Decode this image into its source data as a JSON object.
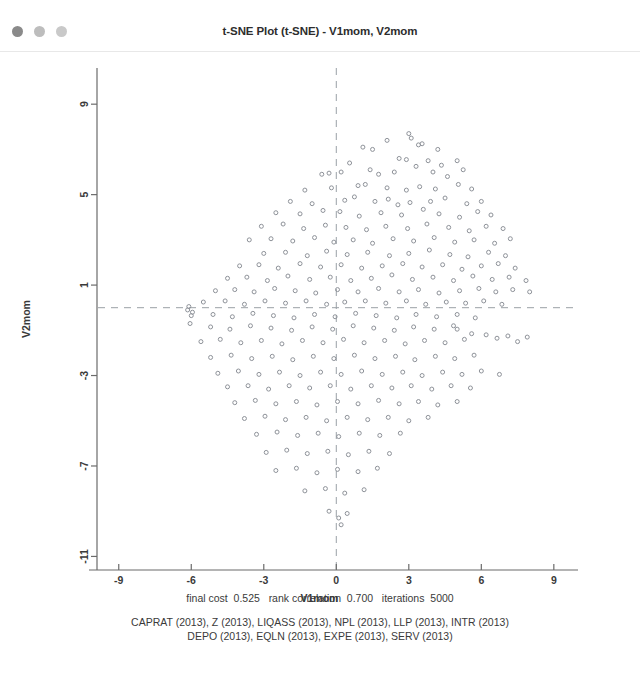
{
  "window": {
    "title": "t-SNE Plot (t-SNE) - V1mom, V2mom",
    "traffic_lights": [
      {
        "name": "close-dot",
        "color": "#8a8a8a"
      },
      {
        "name": "minimize-dot",
        "color": "#bdbdbd"
      },
      {
        "name": "maximize-dot",
        "color": "#c9c9c9"
      }
    ]
  },
  "captions": {
    "fit_stats": "final cost  0.525   rank correlation  0.700   iterations  5000",
    "fit_stats_parts": {
      "final_cost_label": "final cost",
      "final_cost_value": "0.525",
      "rank_correlation_label": "rank correlation",
      "rank_correlation_value": "0.700",
      "iterations_label": "iterations",
      "iterations_value": "5000"
    },
    "variable_line_1": "CAPRAT (2013), Z (2013), LIQASS (2013), NPL (2013), LLP (2013), INTR (2013)",
    "variable_line_2": "DEPO (2013), EQLN (2013), EXPE (2013), SERV (2013)",
    "variables": [
      "CAPRAT (2013)",
      "Z (2013)",
      "LIQASS (2013)",
      "NPL (2013)",
      "LLP (2013)",
      "INTR (2013)",
      "DEPO (2013)",
      "EQLN (2013)",
      "EXPE (2013)",
      "SERV (2013)"
    ]
  },
  "style": {
    "axis_color": "#6b6b6b",
    "marker_stroke": "#8e9299",
    "reference_line_color": "#9aa0a6",
    "text_color": "#3a3a3a",
    "background": "#ffffff"
  },
  "chart_data": {
    "type": "scatter",
    "title": "t-SNE Plot (t-SNE) - V1mom, V2mom",
    "xlabel": "V1mom",
    "ylabel": "V2mom",
    "xlim": [
      -9.9,
      10.0
    ],
    "ylim": [
      -11.6,
      10.6
    ],
    "xticks": [
      -9,
      -6,
      -3,
      0,
      3,
      6,
      9
    ],
    "yticks": [
      9,
      5,
      1,
      -3,
      -7,
      -11
    ],
    "grid": false,
    "legend": null,
    "marker": {
      "shape": "circle-open",
      "size": 4
    },
    "reference_lines": [
      {
        "orientation": "vertical",
        "value": 0.0,
        "style": "dashed"
      },
      {
        "orientation": "horizontal",
        "value": 0.0,
        "style": "dashed"
      }
    ],
    "n_points": 282,
    "points": [
      [
        1.1,
        7.1
      ],
      [
        1.5,
        7.0
      ],
      [
        2.1,
        7.4
      ],
      [
        3.0,
        7.7
      ],
      [
        3.1,
        7.5
      ],
      [
        3.4,
        7.2
      ],
      [
        3.55,
        7.25
      ],
      [
        4.2,
        7.0
      ],
      [
        0.2,
        6.0
      ],
      [
        0.55,
        6.4
      ],
      [
        2.6,
        6.6
      ],
      [
        2.9,
        6.55
      ],
      [
        3.8,
        6.5
      ],
      [
        4.35,
        6.3
      ],
      [
        5.0,
        6.5
      ],
      [
        -0.6,
        5.9
      ],
      [
        -0.3,
        5.95
      ],
      [
        1.4,
        6.1
      ],
      [
        1.75,
        5.9
      ],
      [
        2.4,
        6.0
      ],
      [
        3.3,
        6.25
      ],
      [
        4.0,
        6.0
      ],
      [
        4.6,
        5.8
      ],
      [
        5.25,
        6.1
      ],
      [
        -1.3,
        5.2
      ],
      [
        -0.2,
        5.3
      ],
      [
        0.9,
        5.4
      ],
      [
        1.2,
        5.45
      ],
      [
        2.1,
        5.3
      ],
      [
        2.9,
        5.2
      ],
      [
        3.45,
        5.35
      ],
      [
        4.1,
        5.25
      ],
      [
        5.05,
        5.45
      ],
      [
        5.6,
        5.25
      ],
      [
        -1.9,
        4.7
      ],
      [
        -1.0,
        4.6
      ],
      [
        0.35,
        4.75
      ],
      [
        0.75,
        4.9
      ],
      [
        1.6,
        4.7
      ],
      [
        2.15,
        4.8
      ],
      [
        2.55,
        4.55
      ],
      [
        3.05,
        4.65
      ],
      [
        3.9,
        4.7
      ],
      [
        4.5,
        4.85
      ],
      [
        5.4,
        4.6
      ],
      [
        6.0,
        4.7
      ],
      [
        -2.5,
        4.2
      ],
      [
        -1.5,
        4.15
      ],
      [
        -0.55,
        4.3
      ],
      [
        0.15,
        4.25
      ],
      [
        0.95,
        4.05
      ],
      [
        1.85,
        4.2
      ],
      [
        2.7,
        4.1
      ],
      [
        3.6,
        4.35
      ],
      [
        4.25,
        4.15
      ],
      [
        5.1,
        4.0
      ],
      [
        5.85,
        4.25
      ],
      [
        6.4,
        4.1
      ],
      [
        -3.1,
        3.6
      ],
      [
        -2.2,
        3.7
      ],
      [
        -1.35,
        3.5
      ],
      [
        -0.45,
        3.65
      ],
      [
        0.4,
        3.55
      ],
      [
        1.25,
        3.45
      ],
      [
        2.05,
        3.6
      ],
      [
        2.95,
        3.5
      ],
      [
        3.75,
        3.7
      ],
      [
        4.65,
        3.55
      ],
      [
        5.5,
        3.4
      ],
      [
        6.2,
        3.6
      ],
      [
        6.9,
        3.5
      ],
      [
        -3.6,
        3.0
      ],
      [
        -2.7,
        3.05
      ],
      [
        -1.8,
        2.95
      ],
      [
        -0.9,
        3.1
      ],
      [
        -0.1,
        2.9
      ],
      [
        0.7,
        3.0
      ],
      [
        1.5,
        2.85
      ],
      [
        2.35,
        3.05
      ],
      [
        3.2,
        2.95
      ],
      [
        4.05,
        3.1
      ],
      [
        4.9,
        2.9
      ],
      [
        5.7,
        3.0
      ],
      [
        6.55,
        2.85
      ],
      [
        7.2,
        3.05
      ],
      [
        -3.0,
        2.4
      ],
      [
        -2.1,
        2.45
      ],
      [
        -1.2,
        2.3
      ],
      [
        -0.4,
        2.5
      ],
      [
        0.45,
        2.35
      ],
      [
        1.3,
        2.45
      ],
      [
        2.2,
        2.3
      ],
      [
        3.0,
        2.4
      ],
      [
        3.85,
        2.55
      ],
      [
        4.7,
        2.35
      ],
      [
        5.45,
        2.25
      ],
      [
        6.3,
        2.45
      ],
      [
        7.0,
        2.3
      ],
      [
        -4.0,
        1.85
      ],
      [
        -3.2,
        1.9
      ],
      [
        -2.4,
        1.75
      ],
      [
        -1.5,
        1.95
      ],
      [
        -0.65,
        1.8
      ],
      [
        0.2,
        1.9
      ],
      [
        1.05,
        1.75
      ],
      [
        1.9,
        1.85
      ],
      [
        2.75,
        1.95
      ],
      [
        3.55,
        1.8
      ],
      [
        4.4,
        1.9
      ],
      [
        5.2,
        1.7
      ],
      [
        6.0,
        1.85
      ],
      [
        6.7,
        1.95
      ],
      [
        7.4,
        1.75
      ],
      [
        -4.5,
        1.3
      ],
      [
        -3.7,
        1.35
      ],
      [
        -2.85,
        1.2
      ],
      [
        -2.0,
        1.4
      ],
      [
        -1.1,
        1.25
      ],
      [
        -0.25,
        1.35
      ],
      [
        0.6,
        1.2
      ],
      [
        1.45,
        1.3
      ],
      [
        2.3,
        1.45
      ],
      [
        3.15,
        1.25
      ],
      [
        4.0,
        1.35
      ],
      [
        4.85,
        1.2
      ],
      [
        5.65,
        1.4
      ],
      [
        6.45,
        1.25
      ],
      [
        7.15,
        1.35
      ],
      [
        7.85,
        1.2
      ],
      [
        -5.0,
        0.75
      ],
      [
        -4.2,
        0.8
      ],
      [
        -3.4,
        0.7
      ],
      [
        -2.55,
        0.85
      ],
      [
        -1.7,
        0.75
      ],
      [
        -0.85,
        0.65
      ],
      [
        0.05,
        0.8
      ],
      [
        0.9,
        0.7
      ],
      [
        1.75,
        0.85
      ],
      [
        2.6,
        0.7
      ],
      [
        3.4,
        0.8
      ],
      [
        4.25,
        0.65
      ],
      [
        5.1,
        0.75
      ],
      [
        5.9,
        0.85
      ],
      [
        6.6,
        0.7
      ],
      [
        7.3,
        0.8
      ],
      [
        8.0,
        0.7
      ],
      [
        -5.5,
        0.25
      ],
      [
        -4.6,
        0.3
      ],
      [
        -3.8,
        0.15
      ],
      [
        -2.95,
        0.3
      ],
      [
        -2.1,
        0.2
      ],
      [
        -1.25,
        0.3
      ],
      [
        -0.4,
        0.15
      ],
      [
        0.35,
        0.25
      ],
      [
        1.2,
        0.3
      ],
      [
        2.05,
        0.2
      ],
      [
        2.9,
        0.3
      ],
      [
        3.7,
        0.15
      ],
      [
        4.55,
        0.25
      ],
      [
        5.35,
        0.2
      ],
      [
        6.1,
        0.3
      ],
      [
        6.85,
        0.15
      ],
      [
        -6.0,
        -0.35
      ],
      [
        -5.1,
        -0.3
      ],
      [
        -4.3,
        -0.4
      ],
      [
        -3.45,
        -0.25
      ],
      [
        -2.6,
        -0.35
      ],
      [
        -1.75,
        -0.45
      ],
      [
        -0.9,
        -0.3
      ],
      [
        -0.05,
        -0.4
      ],
      [
        0.8,
        -0.25
      ],
      [
        1.65,
        -0.35
      ],
      [
        2.5,
        -0.45
      ],
      [
        3.3,
        -0.3
      ],
      [
        4.15,
        -0.4
      ],
      [
        5.0,
        -0.3
      ],
      [
        5.75,
        -0.45
      ],
      [
        -6.05,
        -0.7
      ],
      [
        -5.2,
        -0.85
      ],
      [
        -4.4,
        -0.95
      ],
      [
        -3.55,
        -0.8
      ],
      [
        -2.7,
        -0.9
      ],
      [
        -1.85,
        -1.0
      ],
      [
        -1.0,
        -0.85
      ],
      [
        -0.15,
        -0.95
      ],
      [
        0.7,
        -0.8
      ],
      [
        1.55,
        -0.9
      ],
      [
        2.4,
        -1.0
      ],
      [
        3.2,
        -0.85
      ],
      [
        4.05,
        -0.95
      ],
      [
        4.85,
        -0.8
      ],
      [
        -5.6,
        -1.5
      ],
      [
        -4.8,
        -1.4
      ],
      [
        -3.95,
        -1.55
      ],
      [
        -3.1,
        -1.45
      ],
      [
        -2.25,
        -1.6
      ],
      [
        -1.4,
        -1.45
      ],
      [
        -0.55,
        -1.55
      ],
      [
        0.3,
        -1.4
      ],
      [
        1.15,
        -1.55
      ],
      [
        2.0,
        -1.45
      ],
      [
        2.85,
        -1.6
      ],
      [
        3.65,
        -1.45
      ],
      [
        4.5,
        -1.55
      ],
      [
        5.3,
        -1.4
      ],
      [
        -5.2,
        -2.2
      ],
      [
        -4.35,
        -2.1
      ],
      [
        -3.5,
        -2.25
      ],
      [
        -2.65,
        -2.15
      ],
      [
        -1.8,
        -2.3
      ],
      [
        -0.95,
        -2.15
      ],
      [
        -0.1,
        -2.25
      ],
      [
        0.75,
        -2.1
      ],
      [
        1.6,
        -2.25
      ],
      [
        2.45,
        -2.15
      ],
      [
        3.25,
        -2.3
      ],
      [
        4.1,
        -2.15
      ],
      [
        4.9,
        -2.25
      ],
      [
        5.7,
        -2.1
      ],
      [
        -4.9,
        -2.9
      ],
      [
        -4.05,
        -2.8
      ],
      [
        -3.2,
        -2.95
      ],
      [
        -2.35,
        -2.85
      ],
      [
        -1.5,
        -3.0
      ],
      [
        -0.65,
        -2.85
      ],
      [
        0.2,
        -2.95
      ],
      [
        1.05,
        -2.8
      ],
      [
        1.9,
        -2.95
      ],
      [
        2.75,
        -2.85
      ],
      [
        3.55,
        -3.0
      ],
      [
        4.4,
        -2.85
      ],
      [
        5.2,
        -2.95
      ],
      [
        6.0,
        -2.8
      ],
      [
        6.75,
        -2.95
      ],
      [
        -4.5,
        -3.5
      ],
      [
        -3.65,
        -3.45
      ],
      [
        -2.8,
        -3.6
      ],
      [
        -1.95,
        -3.45
      ],
      [
        -1.1,
        -3.55
      ],
      [
        -0.25,
        -3.45
      ],
      [
        0.6,
        -3.6
      ],
      [
        1.45,
        -3.45
      ],
      [
        2.3,
        -3.55
      ],
      [
        3.1,
        -3.45
      ],
      [
        3.95,
        -3.6
      ],
      [
        4.75,
        -3.45
      ],
      [
        5.55,
        -3.55
      ],
      [
        -4.2,
        -4.2
      ],
      [
        -3.35,
        -4.1
      ],
      [
        -2.5,
        -4.25
      ],
      [
        -1.65,
        -4.15
      ],
      [
        -0.8,
        -4.3
      ],
      [
        0.05,
        -4.15
      ],
      [
        0.9,
        -4.25
      ],
      [
        1.75,
        -4.1
      ],
      [
        2.6,
        -4.25
      ],
      [
        3.4,
        -4.15
      ],
      [
        4.2,
        -4.3
      ],
      [
        5.0,
        -4.15
      ],
      [
        -3.8,
        -4.9
      ],
      [
        -2.95,
        -4.8
      ],
      [
        -2.1,
        -4.95
      ],
      [
        -1.25,
        -4.85
      ],
      [
        -0.4,
        -5.0
      ],
      [
        0.45,
        -4.85
      ],
      [
        1.3,
        -4.95
      ],
      [
        2.15,
        -4.85
      ],
      [
        3.0,
        -5.0
      ],
      [
        3.8,
        -4.85
      ],
      [
        -3.3,
        -5.6
      ],
      [
        -2.45,
        -5.5
      ],
      [
        -1.6,
        -5.65
      ],
      [
        -0.75,
        -5.55
      ],
      [
        0.1,
        -5.7
      ],
      [
        0.95,
        -5.55
      ],
      [
        1.8,
        -5.65
      ],
      [
        2.65,
        -5.55
      ],
      [
        -2.9,
        -6.4
      ],
      [
        -2.05,
        -6.3
      ],
      [
        -1.2,
        -6.45
      ],
      [
        -0.35,
        -6.35
      ],
      [
        0.5,
        -6.5
      ],
      [
        1.35,
        -6.35
      ],
      [
        2.2,
        -6.45
      ],
      [
        -2.5,
        -7.2
      ],
      [
        -1.65,
        -7.1
      ],
      [
        -0.8,
        -7.3
      ],
      [
        0.05,
        -7.15
      ],
      [
        0.9,
        -7.25
      ],
      [
        1.7,
        -7.1
      ],
      [
        -1.3,
        -8.1
      ],
      [
        -0.45,
        -8.0
      ],
      [
        0.35,
        -8.2
      ],
      [
        1.15,
        -8.05
      ],
      [
        -0.3,
        -9.0
      ],
      [
        0.1,
        -9.3
      ],
      [
        0.2,
        -9.6
      ],
      [
        0.45,
        -9.1
      ],
      [
        5.0,
        -0.95
      ],
      [
        5.6,
        -1.15
      ],
      [
        6.2,
        -1.2
      ],
      [
        6.65,
        -1.35
      ],
      [
        7.1,
        -1.25
      ],
      [
        7.5,
        -1.5
      ],
      [
        7.9,
        -1.3
      ],
      [
        -6.1,
        0.05
      ],
      [
        -6.15,
        -0.1
      ],
      [
        -5.95,
        -0.2
      ]
    ]
  }
}
